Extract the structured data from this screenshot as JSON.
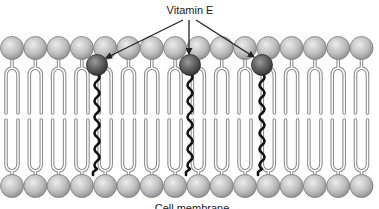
{
  "diagram": {
    "title_label": "Vitamin E",
    "bottom_caption": "Cell membrane",
    "colors": {
      "background": "#ffffff",
      "head_fill_light": "#e6e6e6",
      "head_fill_dark": "#9a9a9a",
      "head_stroke": "#7a7a7a",
      "tail_stroke": "#8f8f8f",
      "tail_inner": "#ffffff",
      "vitamin_head_light": "#8a8a8a",
      "vitamin_head_dark": "#3c3c3c",
      "vitamin_tail": "#111111",
      "arrow": "#222222"
    },
    "bilayer": {
      "head_count_per_row": 16,
      "head_spacing": 23.3,
      "first_head_x": 12,
      "head_radius": 11.5,
      "top_row_y": 48,
      "bottom_row_y": 186,
      "top_fork_y": 72,
      "top_tail_end_y": 113,
      "bottom_tail_start_y": 120,
      "bottom_fork_y": 167,
      "tail_half_gap": 6
    },
    "vitamin_e": {
      "molecules": [
        {
          "x": 97,
          "y": 65
        },
        {
          "x": 190,
          "y": 65
        },
        {
          "x": 262,
          "y": 65
        }
      ],
      "head_radius": 10.5,
      "tail_end_y": 175
    },
    "label_position": {
      "x": 190,
      "y": 4
    },
    "arrows": [
      {
        "from": [
          183,
          20
        ],
        "to": [
          106,
          58
        ]
      },
      {
        "from": [
          189,
          20
        ],
        "to": [
          189,
          54
        ]
      },
      {
        "from": [
          196,
          20
        ],
        "to": [
          254,
          57
        ]
      }
    ],
    "caption_position": {
      "x": 192,
      "y": 202
    }
  }
}
